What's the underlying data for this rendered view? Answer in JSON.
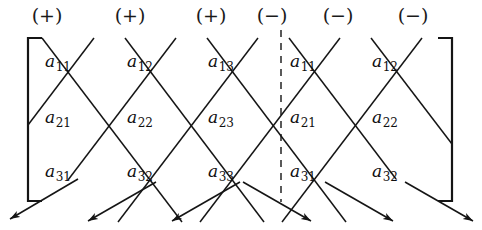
{
  "figure": {
    "line_color": "#151515",
    "text_color": "#101010",
    "background_color": "#ffffff"
  },
  "signs": {
    "plus": "(+)",
    "minus": "(−)",
    "row": [
      {
        "label": "(+)",
        "x": 47,
        "y": 4
      },
      {
        "label": "(+)",
        "x": 130,
        "y": 4
      },
      {
        "label": "(+)",
        "x": 211,
        "y": 4
      },
      {
        "label": "(−)",
        "x": 272,
        "y": 4
      },
      {
        "label": "(−)",
        "x": 338,
        "y": 4
      },
      {
        "label": "(−)",
        "x": 413,
        "y": 4
      }
    ]
  },
  "matrix": {
    "columns": 5,
    "rows": 3,
    "column_x": [
      58,
      140,
      221,
      303,
      385
    ],
    "row_y": [
      62,
      118,
      172
    ],
    "entries": [
      [
        {
          "base": "a",
          "sub": "11"
        },
        {
          "base": "a",
          "sub": "12"
        },
        {
          "base": "a",
          "sub": "13"
        },
        {
          "base": "a",
          "sub": "11"
        },
        {
          "base": "a",
          "sub": "12"
        }
      ],
      [
        {
          "base": "a",
          "sub": "21"
        },
        {
          "base": "a",
          "sub": "22"
        },
        {
          "base": "a",
          "sub": "23"
        },
        {
          "base": "a",
          "sub": "21"
        },
        {
          "base": "a",
          "sub": "22"
        }
      ],
      [
        {
          "base": "a",
          "sub": "31"
        },
        {
          "base": "a",
          "sub": "32"
        },
        {
          "base": "a",
          "sub": "33"
        },
        {
          "base": "a",
          "sub": "31"
        },
        {
          "base": "a",
          "sub": "32"
        }
      ]
    ]
  },
  "brackets": {
    "left": {
      "x": 28,
      "top": 38,
      "bottom": 201,
      "tick": 14
    },
    "right": {
      "x": 452,
      "top": 38,
      "bottom": 201,
      "tick": 14
    }
  },
  "separator": {
    "type": "dashed-vertical",
    "x": 281,
    "top": 30,
    "bottom": 202,
    "dash": "7 6"
  },
  "diagonals": {
    "down_right": [
      {
        "x1": 42,
        "y1": 38,
        "x2": 182,
        "y2": 222
      },
      {
        "x1": 125,
        "y1": 38,
        "x2": 264,
        "y2": 222
      },
      {
        "x1": 207,
        "y1": 38,
        "x2": 346,
        "y2": 222
      },
      {
        "x1": 289,
        "y1": 38,
        "x2": 396,
        "y2": 179
      },
      {
        "x1": 371,
        "y1": 38,
        "x2": 452,
        "y2": 144
      }
    ],
    "down_left": [
      {
        "x1": 422,
        "y1": 38,
        "x2": 282,
        "y2": 222
      },
      {
        "x1": 340,
        "y1": 38,
        "x2": 200,
        "y2": 222
      },
      {
        "x1": 258,
        "y1": 38,
        "x2": 118,
        "y2": 222
      },
      {
        "x1": 176,
        "y1": 38,
        "x2": 68,
        "y2": 180
      },
      {
        "x1": 94,
        "y1": 38,
        "x2": 28,
        "y2": 125
      }
    ]
  },
  "arrows": {
    "down_left": [
      {
        "x1": 78,
        "y1": 179,
        "x2": 10,
        "y2": 219
      },
      {
        "x1": 156,
        "y1": 182,
        "x2": 88,
        "y2": 221
      },
      {
        "x1": 240,
        "y1": 182,
        "x2": 172,
        "y2": 221
      }
    ],
    "down_right": [
      {
        "x1": 243,
        "y1": 182,
        "x2": 311,
        "y2": 221
      },
      {
        "x1": 325,
        "y1": 182,
        "x2": 393,
        "y2": 221
      },
      {
        "x1": 405,
        "y1": 182,
        "x2": 473,
        "y2": 221
      }
    ]
  }
}
